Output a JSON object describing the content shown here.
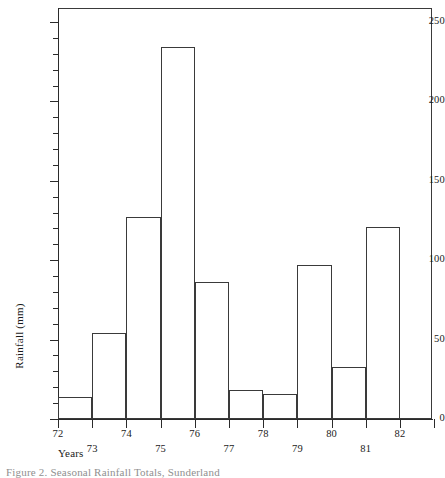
{
  "figure": {
    "caption": "Figure 2.  Seasonal Rainfall Totals, Sunderland",
    "background_color": "#ffffff",
    "line_color": "#3a3a3a"
  },
  "chart_data": {
    "type": "bar",
    "title": "",
    "subtitle": "",
    "xlabel": "Years",
    "ylabel": "Rainfall (mm)",
    "categories": [
      "72",
      "73",
      "74",
      "75",
      "76",
      "77",
      "78",
      "79",
      "80",
      "81"
    ],
    "values": [
      14,
      54,
      127,
      234,
      86,
      18,
      16,
      97,
      33,
      121
    ],
    "ylim": [
      0,
      258
    ],
    "xlim": [
      72,
      83
    ],
    "y_major_ticks": [
      0,
      50,
      100,
      150,
      200,
      250
    ],
    "y_major_tick_labels": [
      "0",
      "50",
      "100",
      "150",
      "200",
      "250"
    ],
    "y_minor_tick_interval": 10,
    "x_ticks": [
      72,
      73,
      74,
      75,
      76,
      77,
      78,
      79,
      80,
      81,
      82,
      83
    ],
    "x_tick_labels": [
      "72",
      "73",
      "74",
      "75",
      "76",
      "77",
      "78",
      "79",
      "80",
      "81",
      "82",
      ""
    ],
    "x_tick_label_rows": [
      0,
      1,
      0,
      1,
      0,
      1,
      0,
      1,
      0,
      1,
      0,
      0
    ],
    "grid": false,
    "legend": null,
    "bar_style": "outline",
    "bar_fill": "none",
    "bar_edge_color": "#3a3a3a"
  }
}
